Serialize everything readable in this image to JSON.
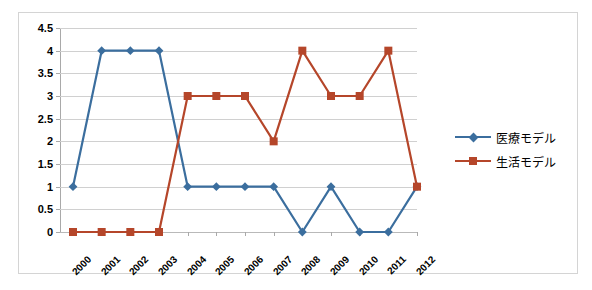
{
  "chart_data": {
    "type": "line",
    "title": "",
    "xlabel": "",
    "ylabel": "",
    "categories": [
      "2000",
      "2001",
      "2002",
      "2003",
      "2004",
      "2005",
      "2006",
      "2007",
      "2008",
      "2009",
      "2010",
      "2011",
      "2012"
    ],
    "series": [
      {
        "name": "医療モデル",
        "color": "#3B6E9E",
        "marker": "diamond",
        "values": [
          1,
          4,
          4,
          4,
          1,
          1,
          1,
          1,
          0,
          1,
          0,
          0,
          1
        ]
      },
      {
        "name": "生活モデル",
        "color": "#B5462A",
        "marker": "square",
        "values": [
          0,
          0,
          0,
          0,
          3,
          3,
          3,
          2,
          4,
          3,
          3,
          4,
          1
        ]
      }
    ],
    "ylim": [
      0,
      4.5
    ],
    "y_ticks": [
      "4.5",
      "4",
      "3.5",
      "3",
      "2.5",
      "2",
      "1.5",
      "1",
      "0.5",
      "0"
    ],
    "y_tick_values": [
      4.5,
      4,
      3.5,
      3,
      2.5,
      2,
      1.5,
      1,
      0.5,
      0
    ],
    "grid": true,
    "legend_position": "right",
    "plot_background": "#FFFFFF",
    "gridline_color": "#D0D0D0",
    "border_color": "#D4D4D4"
  }
}
